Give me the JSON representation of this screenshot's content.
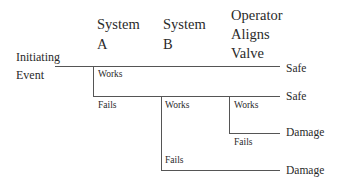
{
  "headers": {
    "initiating_event": [
      "Initiating",
      "Event"
    ],
    "system_a": [
      "System",
      "A"
    ],
    "system_b": [
      "System",
      "B"
    ],
    "operator": [
      "Operator",
      "Aligns",
      "Valve"
    ]
  },
  "branches": {
    "a_works": "Works",
    "a_fails": "Fails",
    "b_works": "Works",
    "b_fails": "Fails",
    "op_works": "Works",
    "op_fails": "Fails"
  },
  "outcomes": [
    "Safe",
    "Safe",
    "Damage",
    "Damage"
  ],
  "colors": {
    "line": "#555555",
    "text": "#2a2a2a",
    "background": "#ffffff"
  }
}
